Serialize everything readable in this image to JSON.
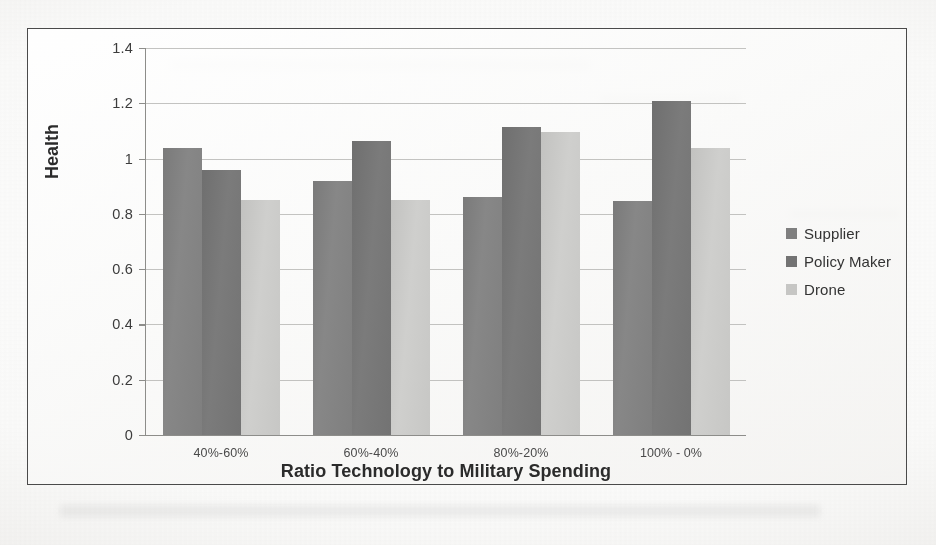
{
  "chart_data": {
    "type": "bar",
    "title": "",
    "xlabel": "Ratio Technology to Military Spending",
    "ylabel": "Health",
    "categories": [
      "40%-60%",
      "60%-40%",
      "80%-20%",
      "100% - 0%"
    ],
    "series": [
      {
        "name": "Supplier",
        "color": "#7f7f7f",
        "values": [
          1.04,
          0.92,
          0.86,
          0.845
        ]
      },
      {
        "name": "Policy Maker",
        "color": "#737373",
        "values": [
          0.96,
          1.065,
          1.115,
          1.21
        ]
      },
      {
        "name": "Drone",
        "color": "#c6c6c4",
        "values": [
          0.85,
          0.85,
          1.095,
          1.04
        ]
      }
    ],
    "ylim": [
      0,
      1.4
    ],
    "ytick_labels": [
      "0",
      "0.2",
      "0.4",
      "0.6",
      "0.8",
      "1",
      "1.2",
      "1.4"
    ],
    "ytick_values": [
      0,
      0.2,
      0.4,
      0.6,
      0.8,
      1,
      1.2,
      1.4
    ],
    "grid": true,
    "legend_position": "right"
  },
  "legend": {
    "items": [
      {
        "label": "Supplier"
      },
      {
        "label": "Policy Maker"
      },
      {
        "label": "Drone"
      }
    ]
  }
}
